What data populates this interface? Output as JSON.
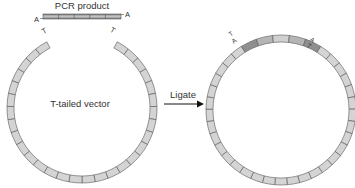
{
  "diagram": {
    "pcr_product": {
      "label": "PCR product",
      "left_overhang": "A",
      "right_overhang": "A",
      "segments": 5
    },
    "vector": {
      "label": "T-tailed vector",
      "left_overhang": "T",
      "right_overhang": "T"
    },
    "step": {
      "label": "Ligate"
    },
    "product": {
      "junction_left_top": "T",
      "junction_left_bottom": "A",
      "junction_right_top": "A",
      "junction_right_bottom": "T"
    },
    "colors": {
      "vector_fill": "#d4d4d4",
      "insert_dark": "#8c8c8c",
      "insert_light": "#c8c8c8",
      "stroke": "#555555",
      "text": "#333333"
    }
  }
}
